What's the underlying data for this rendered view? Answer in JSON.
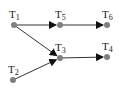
{
  "diagram": {
    "type": "directed-graph",
    "colors": {
      "node": "#808080",
      "edge": "#333333",
      "text": "#222222"
    },
    "nodes": [
      {
        "id": "T1",
        "base": "T",
        "sub": "1",
        "x": 14,
        "y": 25
      },
      {
        "id": "T5",
        "base": "T",
        "sub": "5",
        "x": 60,
        "y": 25
      },
      {
        "id": "T6",
        "base": "T",
        "sub": "6",
        "x": 107,
        "y": 25
      },
      {
        "id": "T3",
        "base": "T",
        "sub": "3",
        "x": 60,
        "y": 58
      },
      {
        "id": "T4",
        "base": "T",
        "sub": "4",
        "x": 107,
        "y": 57
      },
      {
        "id": "T2",
        "base": "T",
        "sub": "2",
        "x": 13,
        "y": 80
      }
    ],
    "edges": [
      {
        "from": "T1",
        "to": "T5"
      },
      {
        "from": "T5",
        "to": "T6"
      },
      {
        "from": "T1",
        "to": "T3"
      },
      {
        "from": "T2",
        "to": "T3"
      },
      {
        "from": "T3",
        "to": "T4"
      }
    ]
  }
}
